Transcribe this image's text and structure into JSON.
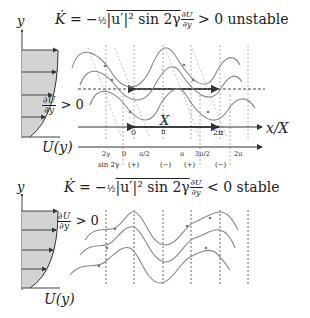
{
  "top_panel": {
    "equation": {
      "lhs": "K̇ = −",
      "half": "½",
      "term": "|u′|² sin 2γ",
      "frac_num": "∂U",
      "frac_den": "∂y",
      "rhs": "> 0 unstable"
    },
    "y_axis_label": "y",
    "profile_label": "U(y)",
    "shear_num": "∂U",
    "shear_den": "∂y",
    "shear_cond": "> 0",
    "x_axis_label": "x/X",
    "wavelength_label": "X",
    "axis_ticks": [
      "0",
      "π",
      "2π"
    ],
    "phase_ticks": [
      "2γ",
      "0",
      "π/2",
      "π",
      "3π/2",
      "2π"
    ],
    "sin_label": "sin 2γ",
    "sin_signs": [
      "(+)",
      "(−)",
      "(+)",
      "(−)"
    ]
  },
  "bottom_panel": {
    "equation": {
      "lhs": "K̇ = −",
      "half": "½",
      "term": "|u′|² sin 2γ",
      "frac_num": "∂U",
      "frac_den": "∂y",
      "rhs": "< 0 stable"
    },
    "y_axis_label": "y",
    "profile_label": "U(y)",
    "shear_num": "∂U",
    "shear_den": "∂y",
    "shear_cond": "> 0"
  }
}
